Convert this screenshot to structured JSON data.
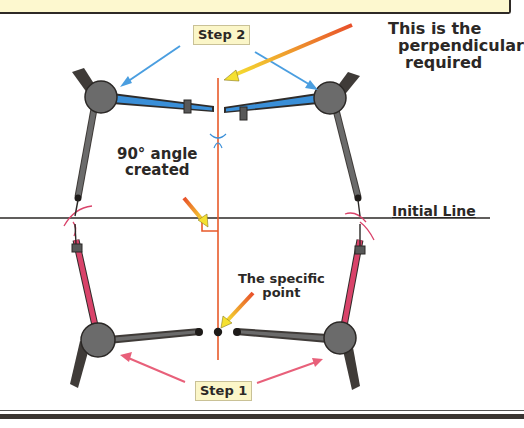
{
  "diagram": {
    "labels": {
      "step_2": "Step 2",
      "step_1": "Step 1",
      "perpendicular_note": [
        "This is the",
        "perpendicular",
        "required"
      ],
      "angle_note": [
        "90° angle",
        "created"
      ],
      "point_note": [
        "The specific",
        "point"
      ],
      "initial_line": "Initial Line"
    },
    "colors": {
      "banner_bg": "#fdf8cf",
      "compass_body": "#6b6b6b",
      "compass_dark": "#3f3b38",
      "step2_leg": "#3a8fd8",
      "step1_leg": "#d9436a",
      "perpendicular_line": "#e85a2a",
      "arrow_gradient_start": "#e84f2a",
      "arrow_gradient_end": "#f5e030",
      "step2_arrow": "#4a9ee0",
      "step1_arrow": "#e8607a",
      "line": "#2b2826"
    }
  }
}
